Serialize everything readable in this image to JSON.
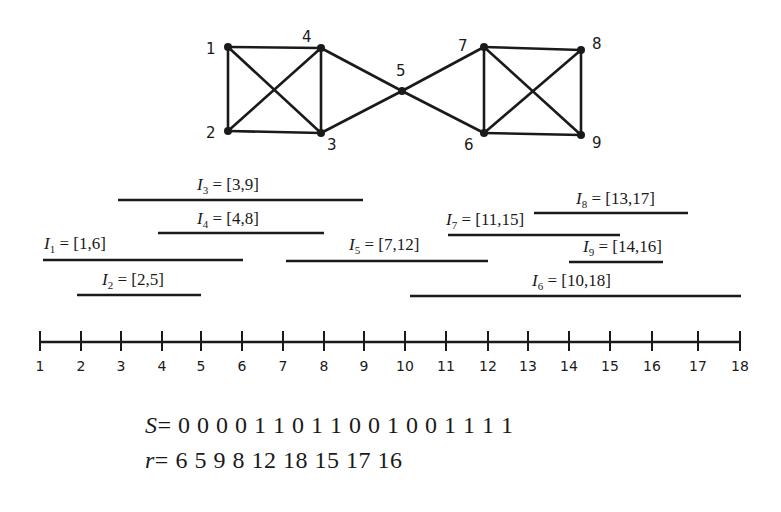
{
  "graph": {
    "nodes": [
      {
        "id": "1",
        "x": 228,
        "y": 47,
        "lx": 206,
        "ly": 54
      },
      {
        "id": "2",
        "x": 228,
        "y": 131,
        "lx": 206,
        "ly": 138
      },
      {
        "id": "3",
        "x": 321,
        "y": 133,
        "lx": 327,
        "ly": 150
      },
      {
        "id": "4",
        "x": 321,
        "y": 48,
        "lx": 302,
        "ly": 42
      },
      {
        "id": "5",
        "x": 402,
        "y": 91,
        "lx": 396,
        "ly": 76
      },
      {
        "id": "6",
        "x": 484,
        "y": 133,
        "lx": 464,
        "ly": 150
      },
      {
        "id": "7",
        "x": 484,
        "y": 47,
        "lx": 458,
        "ly": 51
      },
      {
        "id": "8",
        "x": 581,
        "y": 50,
        "lx": 592,
        "ly": 49
      },
      {
        "id": "9",
        "x": 581,
        "y": 135,
        "lx": 592,
        "ly": 148
      }
    ],
    "edges": [
      [
        "1",
        "2"
      ],
      [
        "1",
        "4"
      ],
      [
        "1",
        "3"
      ],
      [
        "2",
        "4"
      ],
      [
        "2",
        "3"
      ],
      [
        "3",
        "4"
      ],
      [
        "4",
        "5"
      ],
      [
        "3",
        "5"
      ],
      [
        "5",
        "7"
      ],
      [
        "5",
        "6"
      ],
      [
        "6",
        "7"
      ],
      [
        "7",
        "8"
      ],
      [
        "7",
        "9"
      ],
      [
        "6",
        "8"
      ],
      [
        "6",
        "9"
      ],
      [
        "8",
        "9"
      ]
    ],
    "edge_color": "#1a1a1a",
    "node_color": "#1a1a1a"
  },
  "intervals": [
    {
      "name": "I",
      "sub": "1",
      "range": "[1,6]",
      "start": 1,
      "end": 6,
      "x1": 43,
      "x2": 243,
      "y": 260,
      "label_x": 44,
      "label_y": 249
    },
    {
      "name": "I",
      "sub": "2",
      "range": "[2,5]",
      "start": 2,
      "end": 5,
      "x1": 77,
      "x2": 201,
      "y": 295,
      "label_x": 102,
      "label_y": 285
    },
    {
      "name": "I",
      "sub": "3",
      "range": "[3,9]",
      "start": 3,
      "end": 9,
      "x1": 118,
      "x2": 363,
      "y": 200,
      "label_x": 197,
      "label_y": 190
    },
    {
      "name": "I",
      "sub": "4",
      "range": "[4,8]",
      "start": 4,
      "end": 8,
      "x1": 158,
      "x2": 324,
      "y": 233,
      "label_x": 197,
      "label_y": 224
    },
    {
      "name": "I",
      "sub": "5",
      "range": "[7,12]",
      "start": 7,
      "end": 12,
      "x1": 286,
      "x2": 488,
      "y": 261,
      "label_x": 349,
      "label_y": 250
    },
    {
      "name": "I",
      "sub": "6",
      "range": "[10,18]",
      "start": 10,
      "end": 18,
      "x1": 410,
      "x2": 741,
      "y": 296,
      "label_x": 532,
      "label_y": 286
    },
    {
      "name": "I",
      "sub": "7",
      "range": "[11,15]",
      "start": 11,
      "end": 15,
      "x1": 448,
      "x2": 620,
      "y": 235,
      "label_x": 446,
      "label_y": 225
    },
    {
      "name": "I",
      "sub": "8",
      "range": "[13,17]",
      "start": 13,
      "end": 17,
      "x1": 534,
      "x2": 688,
      "y": 213,
      "label_x": 576,
      "label_y": 204
    },
    {
      "name": "I",
      "sub": "9",
      "range": "[14,16]",
      "start": 14,
      "end": 16,
      "x1": 569,
      "x2": 663,
      "y": 262,
      "label_x": 583,
      "label_y": 252
    }
  ],
  "axis": {
    "y": 342,
    "x_start": 40,
    "x_end": 740,
    "ticks": [
      {
        "label": "1",
        "x": 40
      },
      {
        "label": "2",
        "x": 81
      },
      {
        "label": "3",
        "x": 121
      },
      {
        "label": "4",
        "x": 162
      },
      {
        "label": "5",
        "x": 201
      },
      {
        "label": "6",
        "x": 242
      },
      {
        "label": "7",
        "x": 283
      },
      {
        "label": "8",
        "x": 324
      },
      {
        "label": "9",
        "x": 364
      },
      {
        "label": "10",
        "x": 405
      },
      {
        "label": "11",
        "x": 446
      },
      {
        "label": "12",
        "x": 488
      },
      {
        "label": "13",
        "x": 528
      },
      {
        "label": "14",
        "x": 569
      },
      {
        "label": "15",
        "x": 610
      },
      {
        "label": "16",
        "x": 652
      },
      {
        "label": "17",
        "x": 698
      },
      {
        "label": "18",
        "x": 740
      }
    ]
  },
  "sequences": {
    "s_var": "S",
    "s_values": "= 0 0 0 0 1 1 0 1 1 0 0 1 0 0 1 1 1 1",
    "r_var": "r",
    "r_values": "= 6 5 9 8 12 18 15 17 16"
  }
}
